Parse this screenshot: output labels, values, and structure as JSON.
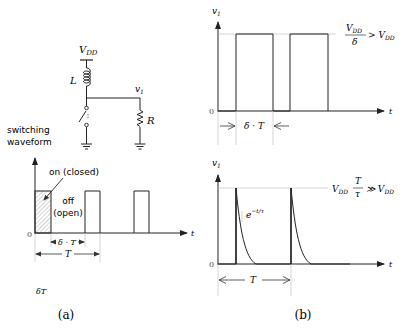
{
  "panel_a": {
    "caption": "(a)",
    "circuit": {
      "supply_label": "V",
      "supply_sub": "DD",
      "inductor_label": "L",
      "node_label": "v",
      "node_sub": "1",
      "resistor_label": "R"
    },
    "waveform": {
      "axis_title_line1": "switching",
      "axis_title_line2": "waveform",
      "on_label": "on (closed)",
      "off_label_line1": "off",
      "off_label_line2": "(open)",
      "origin_label": "0",
      "x_axis_label": "t",
      "delta_t_label": "δ · T",
      "period_label": "T",
      "pulses": 3,
      "duty_cycle_note": "δT"
    }
  },
  "panel_b": {
    "caption": "(b)",
    "top_plot": {
      "y_axis_label": "v",
      "y_axis_sub": "1",
      "origin_label": "0",
      "x_axis_label": "t",
      "level_label": "V_DD/δ > V_DD",
      "level_num": "V",
      "level_num_sub": "DD",
      "level_den": "δ",
      "level_rhs": "> V",
      "level_rhs_sub": "DD",
      "width_label": "δ · T",
      "pulses": 2
    },
    "bottom_plot": {
      "y_axis_label": "v",
      "y_axis_sub": "1",
      "origin_label": "0",
      "x_axis_label": "t",
      "level_lhs": "V",
      "level_lhs_sub": "DD",
      "level_num": "T",
      "level_den": "τ",
      "level_rhs": "≫ V",
      "level_rhs_sub": "DD",
      "decay_label": "e",
      "decay_exp": "−t/τ",
      "period_label": "T",
      "spikes": 2
    }
  },
  "colors": {
    "ink": "#222222",
    "guide": "#bbbbbb",
    "hatch": "#999999"
  }
}
